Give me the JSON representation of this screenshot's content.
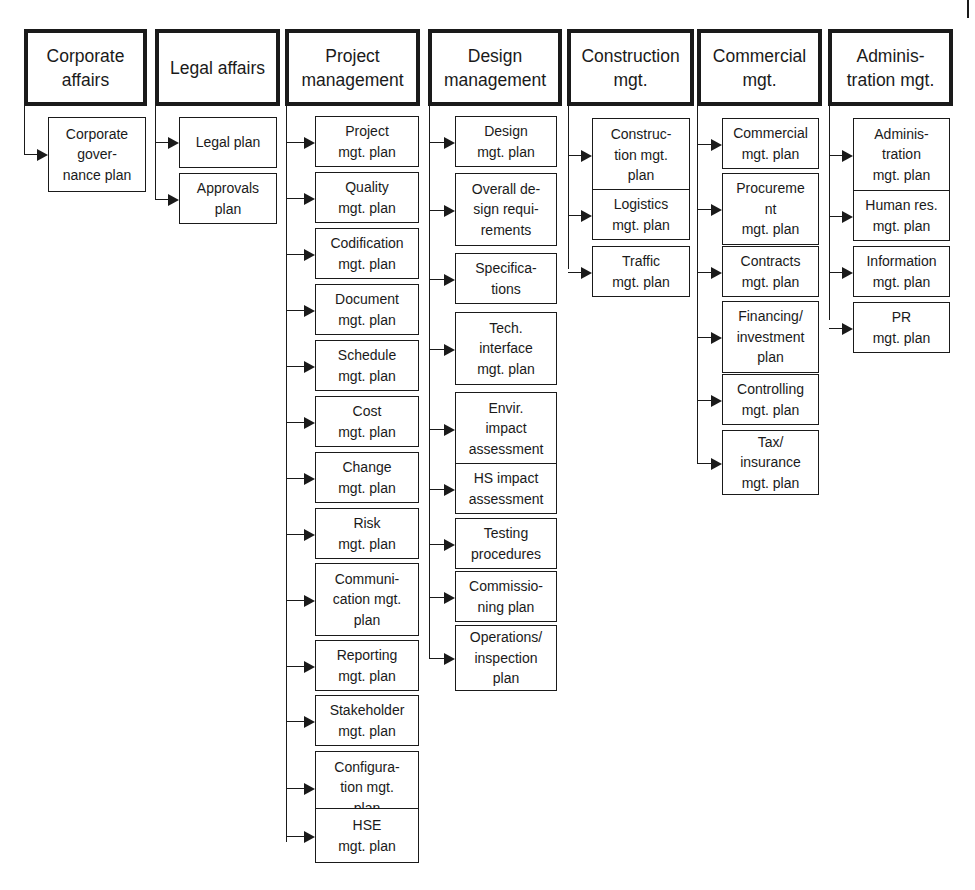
{
  "diagram": {
    "type": "organizational-breakdown",
    "columns": [
      {
        "id": "corporate-affairs",
        "title": "Corporate\naffairs",
        "items": [
          "Corporate\ngover-\nnance plan"
        ]
      },
      {
        "id": "legal-affairs",
        "title": "Legal affairs",
        "items": [
          "Legal plan",
          "Approvals\nplan"
        ]
      },
      {
        "id": "project-management",
        "title": "Project\nmanagement",
        "items": [
          "Project\nmgt. plan",
          "Quality\nmgt. plan",
          "Codification\nmgt. plan",
          "Document\nmgt. plan",
          "Schedule\nmgt. plan",
          "Cost\nmgt. plan",
          "Change\nmgt. plan",
          "Risk\nmgt. plan",
          "Communi-\ncation mgt.\nplan",
          "Reporting\nmgt. plan",
          "Stakeholder\nmgt. plan",
          "Configura-\ntion mgt.\nplan",
          "HSE\nmgt. plan"
        ]
      },
      {
        "id": "design-management",
        "title": "Design\nmanagement",
        "items": [
          "Design\nmgt. plan",
          "Overall de-\nsign requi-\nrements",
          "Specifica-\ntions",
          "Tech.\ninterface\nmgt. plan",
          "Envir.\nimpact\nassessment",
          "HS impact\nassessment",
          "Testing\nprocedures",
          "Commissio-\nning plan",
          "Operations/\ninspection\nplan"
        ]
      },
      {
        "id": "construction-mgt",
        "title": "Construction\nmgt.",
        "items": [
          "Construc-\ntion mgt.\nplan",
          "Logistics\nmgt. plan",
          "Traffic\nmgt. plan"
        ]
      },
      {
        "id": "commercial-mgt",
        "title": "Commercial\nmgt.",
        "items": [
          "Commercial\nmgt. plan",
          "Procureme\nnt\nmgt. plan",
          "Contracts\nmgt. plan",
          "Financing/\ninvestment\nplan",
          "Controlling\nmgt. plan",
          "Tax/\ninsurance\nmgt. plan"
        ]
      },
      {
        "id": "administration-mgt",
        "title": "Adminis-\ntration mgt.",
        "items": [
          "Adminis-\ntration\nmgt. plan",
          "Human res.\nmgt. plan",
          "Information\nmgt. plan",
          "PR\nmgt. plan"
        ]
      }
    ]
  }
}
